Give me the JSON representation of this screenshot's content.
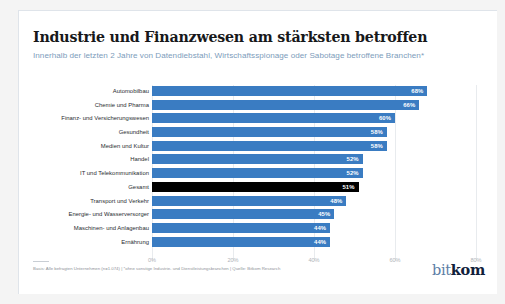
{
  "header": {
    "title": "Industrie und Finanzwesen am stärksten betroffen",
    "subtitle": "Innerhalb der letzten 2 Jahre von Datendiebstahl, Wirtschaftsspionage oder Sabotage betroffene Branchen*"
  },
  "footer": {
    "source": "Basis: Alle befragten Unternehmen (n=1.074) | *ohne sonstige Industrie- und Dienstleistungsbranchen | Quelle: Bitkom Research",
    "logo_part1": "bit",
    "logo_part2": "kom"
  },
  "colors": {
    "bar": "#3a7cc2",
    "bar_highlight": "#000000",
    "subtitle": "#7d9cbb",
    "grid": "#e8ebee",
    "card": "#ffffff",
    "page": "#f4f4f4"
  },
  "chart_data": {
    "type": "bar",
    "orientation": "horizontal",
    "title": "Industrie und Finanzwesen am stärksten betroffen",
    "subtitle": "Innerhalb der letzten 2 Jahre von Datendiebstahl, Wirtschaftsspionage oder Sabotage betroffene Branchen*",
    "xlabel": "",
    "ylabel": "",
    "xlim": [
      0,
      80
    ],
    "grid": true,
    "legend": "none",
    "xticks": [
      "0%",
      "20%",
      "40%",
      "60%",
      "80%"
    ],
    "xtick_values": [
      0,
      20,
      40,
      60,
      80
    ],
    "categories": [
      "Automobilbau",
      "Chemie und Pharma",
      "Finanz- und Versicherungswesen",
      "Gesundheit",
      "Medien und Kultur",
      "Handel",
      "IT und Telekommunikation",
      "Gesamt",
      "Transport und Verkehr",
      "Energie- und Wasserversorger",
      "Maschinen- und Anlagenbau",
      "Ernährung"
    ],
    "values": [
      68,
      66,
      60,
      58,
      58,
      52,
      52,
      51,
      48,
      45,
      44,
      44
    ],
    "value_labels": [
      "68%",
      "66%",
      "60%",
      "58%",
      "58%",
      "52%",
      "52%",
      "51%",
      "48%",
      "45%",
      "44%",
      "44%"
    ],
    "highlight_index": 7,
    "bars": [
      {
        "label": "Automobilbau",
        "value": 68,
        "value_label": "68%",
        "highlight": false
      },
      {
        "label": "Chemie und Pharma",
        "value": 66,
        "value_label": "66%",
        "highlight": false
      },
      {
        "label": "Finanz- und Versicherungswesen",
        "value": 60,
        "value_label": "60%",
        "highlight": false
      },
      {
        "label": "Gesundheit",
        "value": 58,
        "value_label": "58%",
        "highlight": false
      },
      {
        "label": "Medien und Kultur",
        "value": 58,
        "value_label": "58%",
        "highlight": false
      },
      {
        "label": "Handel",
        "value": 52,
        "value_label": "52%",
        "highlight": false
      },
      {
        "label": "IT und Telekommunikation",
        "value": 52,
        "value_label": "52%",
        "highlight": false
      },
      {
        "label": "Gesamt",
        "value": 51,
        "value_label": "51%",
        "highlight": true
      },
      {
        "label": "Transport und Verkehr",
        "value": 48,
        "value_label": "48%",
        "highlight": false
      },
      {
        "label": "Energie- und Wasserversorger",
        "value": 45,
        "value_label": "45%",
        "highlight": false
      },
      {
        "label": "Maschinen- und Anlagenbau",
        "value": 44,
        "value_label": "44%",
        "highlight": false
      },
      {
        "label": "Ernährung",
        "value": 44,
        "value_label": "44%",
        "highlight": false
      }
    ]
  }
}
